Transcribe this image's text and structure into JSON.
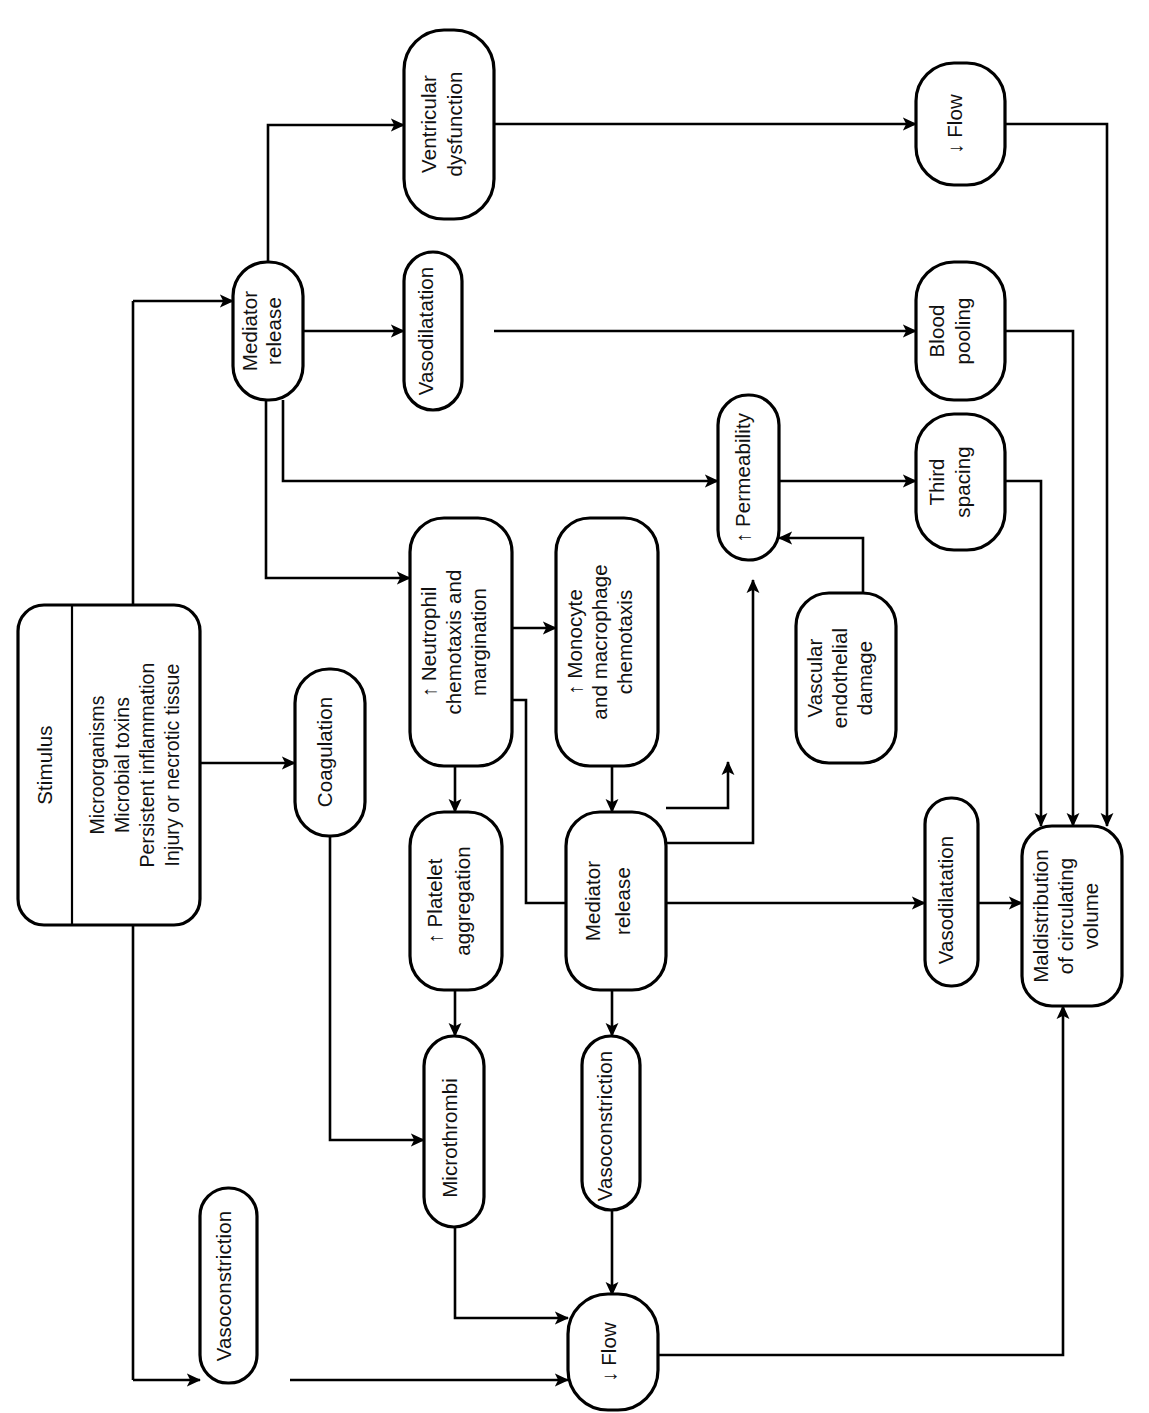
{
  "diagram": {
    "orientation": "rotated-90-ccw",
    "stroke_color": "#000000",
    "background_color": "#ffffff",
    "nodes": [
      {
        "id": "stimulus",
        "label": "Stimulus",
        "shape": "rounded-rect-split"
      },
      {
        "id": "stimulus_list",
        "label": "Microorganisms\nMicrobial toxins\nPersistent inflammation\nInjury or necrotic tissue",
        "lines": [
          "Microorganisms",
          "Microbial toxins",
          "Persistent inflammation",
          "Injury or necrotic tissue"
        ]
      },
      {
        "id": "mediator_top",
        "label": "Mediator release",
        "lines": [
          "Mediator",
          "release"
        ]
      },
      {
        "id": "ventricular",
        "label": "Ventricular dysfunction",
        "lines": [
          "Ventricular",
          "dysfunction"
        ]
      },
      {
        "id": "vasodil_top",
        "label": "Vasodilatation",
        "lines": [
          "Vasodilatation"
        ]
      },
      {
        "id": "flow_top",
        "label": "↓ Flow",
        "lines": [
          "↓ Flow"
        ]
      },
      {
        "id": "blood_pooling",
        "label": "Blood pooling",
        "lines": [
          "Blood",
          "pooling"
        ]
      },
      {
        "id": "third_spacing",
        "label": "Third spacing",
        "lines": [
          "Third",
          "spacing"
        ]
      },
      {
        "id": "permeability",
        "label": "↑ Permeability",
        "lines": [
          "↑ Permeability"
        ]
      },
      {
        "id": "neutrophil",
        "label": "↑ Neutrophil chemotaxis and margination",
        "lines": [
          "↑ Neutrophil",
          "chemotaxis and",
          "margination"
        ]
      },
      {
        "id": "monocyte",
        "label": "↑ Monocyte and macrophage chemotaxis",
        "lines": [
          "↑ Monocyte",
          "and macrophage",
          "chemotaxis"
        ]
      },
      {
        "id": "endothelial",
        "label": "Vascular endothelial damage",
        "lines": [
          "Vascular",
          "endothelial",
          "damage"
        ]
      },
      {
        "id": "coagulation",
        "label": "Coagulation",
        "lines": [
          "Coagulation"
        ]
      },
      {
        "id": "platelet",
        "label": "↑ Platelet aggregation",
        "lines": [
          "↑ Platelet",
          "aggregation"
        ]
      },
      {
        "id": "mediator_mid",
        "label": "Mediator release",
        "lines": [
          "Mediator",
          "release"
        ]
      },
      {
        "id": "vasodil_right",
        "label": "Vasodilatation",
        "lines": [
          "Vasodilatation"
        ]
      },
      {
        "id": "maldistribution",
        "label": "Maldistribution of circulating volume",
        "lines": [
          "Maldistribution",
          "of circulating",
          "volume"
        ]
      },
      {
        "id": "microthrombi",
        "label": "Microthrombi",
        "lines": [
          "Microthrombi"
        ]
      },
      {
        "id": "vasocon_mid",
        "label": "Vasoconstriction",
        "lines": [
          "Vasoconstriction"
        ]
      },
      {
        "id": "vasocon_left",
        "label": "Vasoconstriction",
        "lines": [
          "Vasoconstriction"
        ]
      },
      {
        "id": "flow_bottom",
        "label": "↓ Flow",
        "lines": [
          "↓ Flow"
        ]
      }
    ],
    "edges": [
      {
        "from": "stimulus",
        "to": "mediator_top"
      },
      {
        "from": "stimulus",
        "to": "coagulation"
      },
      {
        "from": "stimulus",
        "to": "neutrophil"
      },
      {
        "from": "stimulus",
        "to": "vasocon_left"
      },
      {
        "from": "mediator_top",
        "to": "ventricular"
      },
      {
        "from": "mediator_top",
        "to": "vasodil_top"
      },
      {
        "from": "mediator_top",
        "to": "permeability"
      },
      {
        "from": "mediator_top",
        "to": "neutrophil"
      },
      {
        "from": "ventricular",
        "to": "flow_top"
      },
      {
        "from": "vasodil_top",
        "to": "blood_pooling"
      },
      {
        "from": "permeability",
        "to": "third_spacing"
      },
      {
        "from": "neutrophil",
        "to": "monocyte"
      },
      {
        "from": "neutrophil",
        "to": "platelet"
      },
      {
        "from": "neutrophil",
        "to": "mediator_mid"
      },
      {
        "from": "monocyte",
        "to": "mediator_mid"
      },
      {
        "from": "coagulation",
        "to": "microthrombi"
      },
      {
        "from": "platelet",
        "to": "microthrombi"
      },
      {
        "from": "mediator_mid",
        "to": "endothelial"
      },
      {
        "from": "mediator_mid",
        "to": "permeability"
      },
      {
        "from": "mediator_mid",
        "to": "vasodil_right"
      },
      {
        "from": "mediator_mid",
        "to": "vasocon_mid"
      },
      {
        "from": "endothelial",
        "to": "permeability"
      },
      {
        "from": "vasodil_right",
        "to": "maldistribution"
      },
      {
        "from": "flow_top",
        "to": "maldistribution"
      },
      {
        "from": "blood_pooling",
        "to": "maldistribution"
      },
      {
        "from": "third_spacing",
        "to": "maldistribution"
      },
      {
        "from": "microthrombi",
        "to": "flow_bottom"
      },
      {
        "from": "vasocon_mid",
        "to": "flow_bottom"
      },
      {
        "from": "vasocon_left",
        "to": "flow_bottom"
      },
      {
        "from": "flow_bottom",
        "to": "maldistribution"
      }
    ]
  }
}
